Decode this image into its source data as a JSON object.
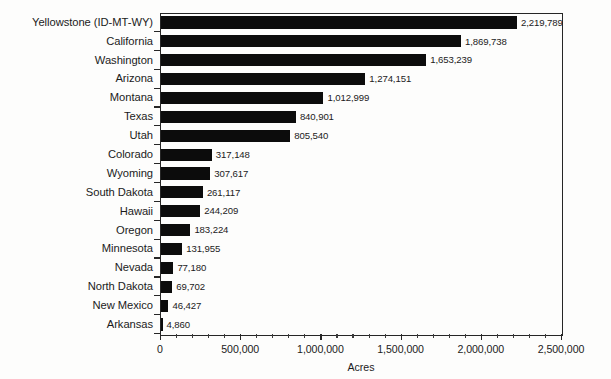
{
  "chart_data": {
    "type": "bar",
    "orientation": "horizontal",
    "title": "",
    "xlabel": "Acres",
    "ylabel": "",
    "xlim": [
      0,
      2500000
    ],
    "grid": false,
    "legend": null,
    "x_tick_labels": [
      "0",
      "500,000",
      "1,000,000",
      "1,500,000",
      "2,000,000",
      "2,500,000"
    ],
    "x_tick_values": [
      0,
      500000,
      1000000,
      1500000,
      2000000,
      2500000
    ],
    "minor_tick_interval": 100000,
    "bar_color": "#0c0c0c",
    "axis_color": "#262626",
    "categories": [
      "Yellowstone (ID-MT-WY)",
      "California",
      "Washington",
      "Arizona",
      "Montana",
      "Texas",
      "Utah",
      "Colorado",
      "Wyoming",
      "South Dakota",
      "Hawaii",
      "Oregon",
      "Minnesota",
      "Nevada",
      "North Dakota",
      "New Mexico",
      "Arkansas"
    ],
    "values": [
      2219789,
      1869738,
      1653239,
      1274151,
      1012999,
      840901,
      805540,
      317148,
      307617,
      261117,
      244209,
      183224,
      131955,
      77180,
      69702,
      46427,
      4860
    ],
    "value_labels": [
      "2,219,789",
      "1,869,738",
      "1,653,239",
      "1,274,151",
      "1,012,999",
      "840,901",
      "805,540",
      "317,148",
      "307,617",
      "261,117",
      "244,209",
      "183,224",
      "131,955",
      "77,180",
      "69,702",
      "46,427",
      "4,860"
    ]
  }
}
